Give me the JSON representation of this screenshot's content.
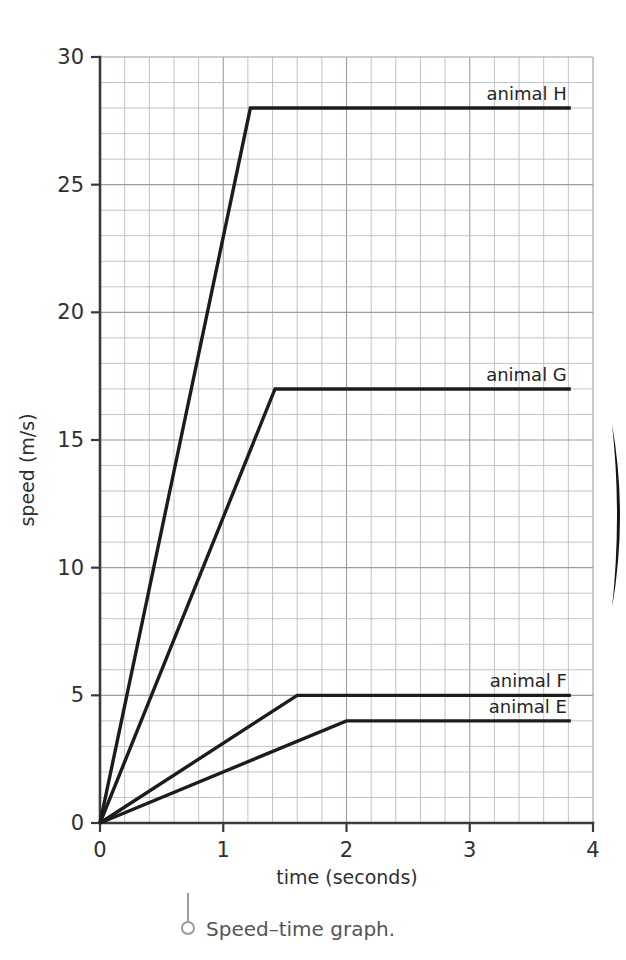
{
  "figure": {
    "caption": "Speed–time graph.",
    "caption_icon": "pin-marker-icon"
  },
  "chart_data": {
    "type": "line",
    "title": "",
    "xlabel": "time (seconds)",
    "ylabel": "speed (m/s)",
    "xlim": [
      0,
      4
    ],
    "ylim": [
      0,
      30
    ],
    "xticks": [
      0,
      1,
      2,
      3,
      4
    ],
    "xtick_labels": [
      "0",
      "1",
      "2",
      "3",
      "4"
    ],
    "yticks": [
      0,
      5,
      10,
      15,
      20,
      25,
      30
    ],
    "ytick_labels": [
      "0",
      "5",
      "10",
      "15",
      "20",
      "25",
      "30"
    ],
    "grid": true,
    "grid_minor_x_step": 0.2,
    "grid_minor_y_step": 1,
    "legend_position": "inline-right-of-line",
    "line_color": "#1c1c1c",
    "series": [
      {
        "name": "animal H",
        "label": "animal H",
        "x": [
          0,
          1.22,
          3.82
        ],
        "y": [
          0,
          28,
          28
        ],
        "plateau_speed": 28,
        "acceleration_end_time": 1.22
      },
      {
        "name": "animal G",
        "label": "animal G",
        "x": [
          0,
          1.42,
          3.82
        ],
        "y": [
          0,
          17,
          17
        ],
        "plateau_speed": 17,
        "acceleration_end_time": 1.42
      },
      {
        "name": "animal F",
        "label": "animal F",
        "x": [
          0,
          1.6,
          3.82
        ],
        "y": [
          0,
          5,
          5
        ],
        "plateau_speed": 5,
        "acceleration_end_time": 1.6
      },
      {
        "name": "animal E",
        "label": "animal E",
        "x": [
          0,
          2.0,
          3.82
        ],
        "y": [
          0,
          4,
          4
        ],
        "plateau_speed": 4,
        "acceleration_end_time": 2.0
      }
    ]
  }
}
